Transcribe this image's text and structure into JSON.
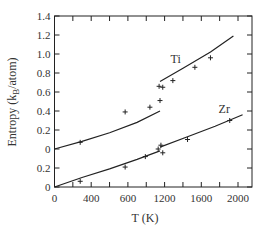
{
  "chart_data": {
    "type": "line",
    "title": "",
    "xlabel": "T (K)",
    "ylabel": "Entropy (k_B/atom)",
    "ylabel_parts": {
      "main": "Entropy (k",
      "sub": "B",
      "tail": "/atom)"
    },
    "xlim": [
      0,
      2150
    ],
    "x_ticks": [
      0,
      200,
      400,
      600,
      800,
      1000,
      1200,
      1400,
      1600,
      1800,
      2000
    ],
    "x_tick_labels": [
      {
        "value": 0,
        "label": "0"
      },
      {
        "value": 400,
        "label": "400"
      },
      {
        "value": 800,
        "label": "600"
      },
      {
        "value": 1200,
        "label": "1200"
      },
      {
        "value": 1600,
        "label": "1600"
      },
      {
        "value": 2000,
        "label": "2000"
      }
    ],
    "y_axis_note": "Offset stacked scale: Zr zero at bottom, Ti zero offset by 0.4",
    "y_tick_labels": [
      {
        "pos": 0.0,
        "label": "0"
      },
      {
        "pos": 0.2,
        "label": "0.2"
      },
      {
        "pos": 0.4,
        "label": "0"
      },
      {
        "pos": 0.6,
        "label": "0.2"
      },
      {
        "pos": 0.8,
        "label": "0.4"
      },
      {
        "pos": 1.0,
        "label": "0.6"
      },
      {
        "pos": 1.2,
        "label": "0.8"
      },
      {
        "pos": 1.4,
        "label": "1.0"
      },
      {
        "pos": 1.6,
        "label": "1.2"
      },
      {
        "pos": 1.8,
        "label": "1.4"
      }
    ],
    "grid": false,
    "legend": "inline labels",
    "series": [
      {
        "name": "Ti",
        "offset": 0.4,
        "label_pos": {
          "T": 1320,
          "S": 0.95
        },
        "line_segments": [
          [
            [
              0,
              0.0
            ],
            [
              300,
              0.08
            ],
            [
              600,
              0.17
            ],
            [
              900,
              0.28
            ],
            [
              1150,
              0.4
            ]
          ],
          [
            [
              1150,
              0.71
            ],
            [
              1400,
              0.85
            ],
            [
              1700,
              1.02
            ],
            [
              1950,
              1.19
            ]
          ]
        ],
        "points": [
          {
            "T": 280,
            "S": 0.07
          },
          {
            "T": 770,
            "S": 0.39
          },
          {
            "T": 1040,
            "S": 0.44
          },
          {
            "T": 1150,
            "S": 0.51
          },
          {
            "T": 1140,
            "S": 0.66
          },
          {
            "T": 1180,
            "S": 0.65
          },
          {
            "T": 1290,
            "S": 0.72
          },
          {
            "T": 1530,
            "S": 0.86
          },
          {
            "T": 1700,
            "S": 0.96
          }
        ]
      },
      {
        "name": "Zr",
        "offset": 0.0,
        "label_pos": {
          "T": 1850,
          "S": 0.82
        },
        "line_segments": [
          [
            [
              0,
              0.0
            ],
            [
              300,
              0.1
            ],
            [
              600,
              0.19
            ],
            [
              900,
              0.29
            ],
            [
              1150,
              0.38
            ]
          ],
          [
            [
              1150,
              0.42
            ],
            [
              1450,
              0.53
            ],
            [
              1750,
              0.64
            ],
            [
              2050,
              0.76
            ]
          ]
        ],
        "points": [
          {
            "T": 280,
            "S": 0.06
          },
          {
            "T": 770,
            "S": 0.21
          },
          {
            "T": 990,
            "S": 0.32
          },
          {
            "T": 1130,
            "S": 0.4
          },
          {
            "T": 1160,
            "S": 0.44
          },
          {
            "T": 1180,
            "S": 0.36
          },
          {
            "T": 1450,
            "S": 0.5
          },
          {
            "T": 1910,
            "S": 0.7
          }
        ]
      }
    ]
  }
}
